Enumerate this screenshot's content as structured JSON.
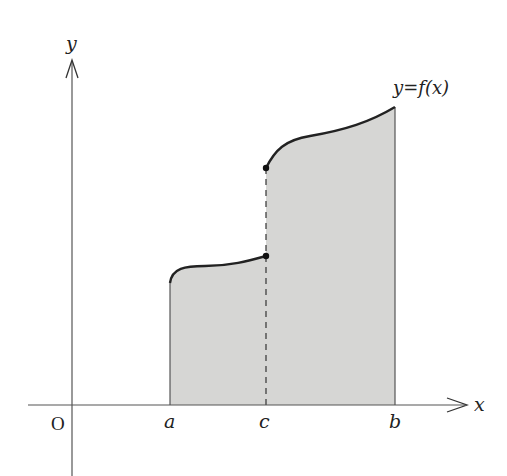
{
  "figure": {
    "axes": {
      "x_label": "x",
      "y_label": "y",
      "origin_label": "O"
    },
    "function_label": "y=f(x)",
    "points": {
      "a": "a",
      "c": "c",
      "b": "b"
    },
    "colors": {
      "fill": "#d6d6d4",
      "curve": "#222222",
      "axis": "#555555"
    }
  }
}
